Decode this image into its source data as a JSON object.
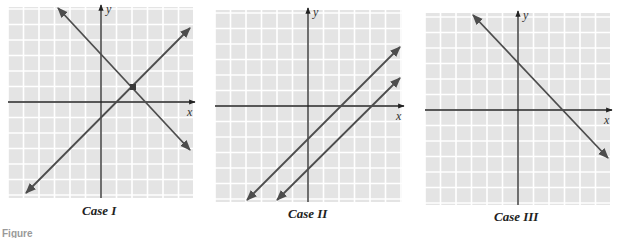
{
  "figure_label": "Figure",
  "colors": {
    "grid_bg": "#e4e4e4",
    "grid_line": "#ffffff",
    "axis": "#222222",
    "line": "#4d4d4d",
    "point": "#3a3a3a"
  },
  "panels": [
    {
      "caption": "Case I",
      "x_label": "x",
      "y_label": "y",
      "box": {
        "left": 8,
        "top": 7,
        "right": 193,
        "bottom": 198
      },
      "origin": {
        "x": 101,
        "y": 102
      },
      "cell": 15.5,
      "lines": [
        {
          "x1": 58,
          "y1": 8,
          "x2": 190,
          "y2": 150
        },
        {
          "x1": 26,
          "y1": 193,
          "x2": 190,
          "y2": 28
        }
      ],
      "points": [
        {
          "x": 133,
          "y": 87
        }
      ],
      "caption_pos": {
        "x": 82,
        "y": 212
      }
    },
    {
      "caption": "Case II",
      "x_label": "x",
      "y_label": "y",
      "box": {
        "left": 10,
        "top": 10,
        "right": 197,
        "bottom": 202
      },
      "origin": {
        "x": 103,
        "y": 106
      },
      "cell": 15.5,
      "lines": [
        {
          "x1": 42,
          "y1": 200,
          "x2": 195,
          "y2": 47
        },
        {
          "x1": 72,
          "y1": 200,
          "x2": 195,
          "y2": 78
        }
      ],
      "points": [],
      "caption_pos": {
        "x": 83,
        "y": 215
      }
    },
    {
      "caption": "Case III",
      "x_label": "x",
      "y_label": "y",
      "box": {
        "left": 15,
        "top": 13,
        "right": 200,
        "bottom": 205
      },
      "origin": {
        "x": 108,
        "y": 110
      },
      "cell": 15.5,
      "lines": [
        {
          "x1": 63,
          "y1": 15,
          "x2": 198,
          "y2": 158
        }
      ],
      "points": [],
      "caption_pos": {
        "x": 84,
        "y": 218
      }
    }
  ],
  "chart_data": [
    {
      "type": "line",
      "title": "Case I",
      "description": "Two lines intersecting at exactly one point (one solution)",
      "xlabel": "x",
      "ylabel": "y",
      "grid": true,
      "series": [
        {
          "name": "line 1",
          "slope": -1,
          "y_intercept": 3
        },
        {
          "name": "line 2",
          "slope": 1,
          "y_intercept": -1
        }
      ],
      "intersection": {
        "x": 2,
        "y": 1
      }
    },
    {
      "type": "line",
      "title": "Case II",
      "description": "Two parallel lines, no intersection (no solution)",
      "xlabel": "x",
      "ylabel": "y",
      "grid": true,
      "series": [
        {
          "name": "line 1",
          "slope": 1,
          "y_intercept": -2
        },
        {
          "name": "line 2",
          "slope": 1,
          "y_intercept": -4
        }
      ]
    },
    {
      "type": "line",
      "title": "Case III",
      "description": "Coincident lines (infinitely many solutions)",
      "xlabel": "x",
      "ylabel": "y",
      "grid": true,
      "series": [
        {
          "name": "line",
          "slope": -1,
          "y_intercept": 3
        }
      ]
    }
  ]
}
